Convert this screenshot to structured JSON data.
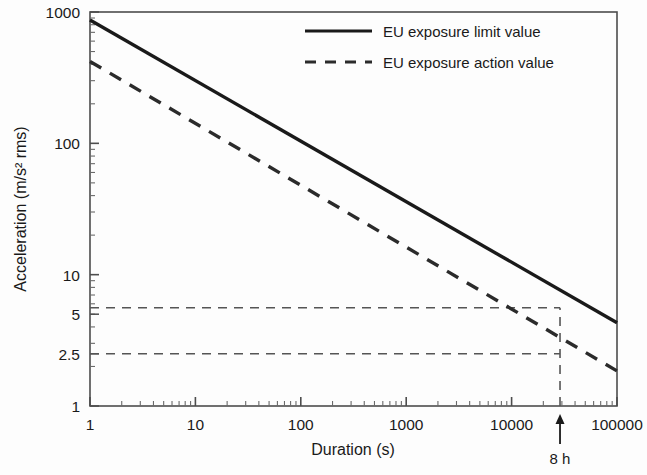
{
  "chart_data": {
    "type": "line",
    "title": "",
    "xlabel": "Duration (s)",
    "ylabel": "Acceleration (m/s² rms)",
    "xscale": "log",
    "yscale": "log",
    "xlim": [
      1,
      100000
    ],
    "ylim": [
      1,
      1000
    ],
    "grid": false,
    "legend_position": "top-right",
    "xticks": [
      1,
      10,
      100,
      1000,
      10000,
      100000
    ],
    "xtick_labels": [
      "1",
      "10",
      "100",
      "1000",
      "10000",
      "100000"
    ],
    "yticks": [
      1,
      2.5,
      5,
      10,
      100,
      1000
    ],
    "ytick_labels": [
      "1",
      "2.5",
      "5",
      "10",
      "100",
      "1000"
    ],
    "series": [
      {
        "name": "EU exposure limit value",
        "style": "solid",
        "color": "#1a1a1a",
        "x": [
          1,
          100000
        ],
        "y": [
          870,
          4.3
        ]
      },
      {
        "name": "EU exposure action value",
        "style": "dashed",
        "color": "#2b2b2b",
        "x": [
          1,
          100000
        ],
        "y": [
          420,
          1.85
        ]
      }
    ],
    "annotations": [
      {
        "name": "eight-hour-marker",
        "label": "8 h",
        "x": 28800,
        "type": "arrow-up-below-axis"
      },
      {
        "name": "limit-value-at-8h-guide",
        "label": "",
        "type": "guide-dashed",
        "x_from": 1,
        "x_to": 28800,
        "y": 5.6
      },
      {
        "name": "action-value-at-8h-guide",
        "label": "",
        "type": "guide-dashed",
        "x_from": 1,
        "x_to": 28800,
        "y": 2.5
      },
      {
        "name": "eight-hour-vertical-guide",
        "label": "",
        "type": "guide-dashed-vertical",
        "x": 28800,
        "y_from": 1,
        "y_to": 5.6
      }
    ]
  },
  "axes": {
    "x_title": "Duration (s)",
    "y_title": "Acceleration (m/s² rms)"
  },
  "legend": {
    "items": [
      {
        "label": "EU exposure limit value",
        "style": "solid"
      },
      {
        "label": "EU exposure action value",
        "style": "dashed"
      }
    ]
  },
  "annotation_labels": {
    "eight_hour": "8 h"
  },
  "colors": {
    "line": "#1a1a1a",
    "guide": "#555555",
    "frame": "#4d4d4d",
    "background": "#fdfdfd"
  }
}
